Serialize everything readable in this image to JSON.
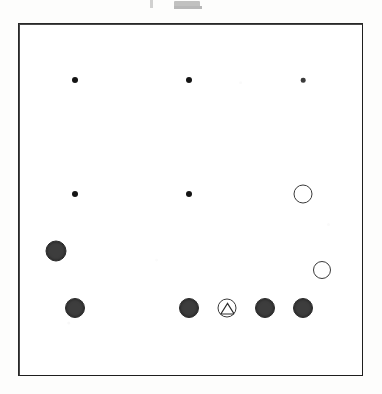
{
  "diagram": {
    "type": "go-board-diagram",
    "board_size": 19,
    "visible_columns": 19,
    "visible_rows": 19,
    "title": "",
    "caption_remnant": "",
    "colors": {
      "line": "#6b6b6b",
      "line_thick": "#2f2f2f",
      "frame": "#1e1e1e",
      "black_stone": "#3d3d3d",
      "white_stone": "#ffffff",
      "white_stone_edge": "#3a3a3a",
      "paper": "#fdfdfc"
    },
    "grid": {
      "origin_x": 18,
      "origin_y": 23,
      "spacing": 19.0,
      "thick_every": 3
    },
    "hoshi_points": [
      {
        "col": 3,
        "row": 3,
        "size": "large"
      },
      {
        "col": 9,
        "row": 3,
        "size": "large"
      },
      {
        "col": 15,
        "row": 3,
        "size": "small"
      },
      {
        "col": 3,
        "row": 9,
        "size": "large"
      },
      {
        "col": 9,
        "row": 9,
        "size": "large"
      }
    ],
    "stones": [
      {
        "id": "b1",
        "color": "black",
        "col": 2,
        "row": 12,
        "radius": 10.5,
        "marker": "none",
        "label": "black-stone"
      },
      {
        "id": "b2",
        "color": "black",
        "col": 3,
        "row": 15,
        "radius": 10.0,
        "marker": "none",
        "label": "black-stone"
      },
      {
        "id": "b3",
        "color": "black",
        "col": 9,
        "row": 15,
        "radius": 10.0,
        "marker": "none",
        "label": "black-stone"
      },
      {
        "id": "b4",
        "color": "black",
        "col": 13,
        "row": 15,
        "radius": 10.0,
        "marker": "none",
        "label": "black-stone"
      },
      {
        "id": "b5",
        "color": "black",
        "col": 15,
        "row": 15,
        "radius": 10.0,
        "marker": "none",
        "label": "black-stone"
      },
      {
        "id": "w1",
        "color": "white",
        "col": 15,
        "row": 9,
        "radius": 9.5,
        "marker": "none",
        "label": "white-stone"
      },
      {
        "id": "w2",
        "color": "white",
        "col": 16,
        "row": 13,
        "radius": 9.0,
        "marker": "none",
        "label": "white-stone"
      },
      {
        "id": "w3",
        "color": "white",
        "col": 11,
        "row": 15,
        "radius": 9.5,
        "marker": "triangle",
        "label": "white-stone-marked"
      }
    ],
    "markers": {
      "triangle_count": 1,
      "triangle_on": "w3"
    },
    "counts": {
      "black_stones": 5,
      "white_stones": 3,
      "marked_stones": 1
    }
  }
}
